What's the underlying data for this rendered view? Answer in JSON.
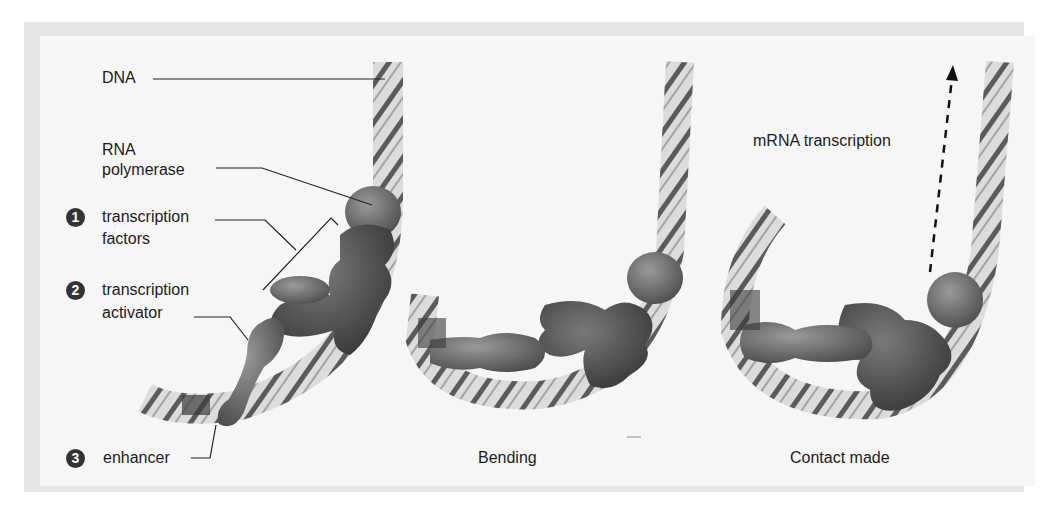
{
  "figure": {
    "panels": [
      {
        "id": "initial",
        "caption": ""
      },
      {
        "id": "bending",
        "caption": "Bending"
      },
      {
        "id": "contact",
        "caption": "Contact made"
      }
    ],
    "labels": {
      "dna": "DNA",
      "rna_polymerase_line1": "RNA",
      "rna_polymerase_line2": "polymerase",
      "transcription_factors_line1": "transcription",
      "transcription_factors_line2": "factors",
      "transcription_activator_line1": "transcription",
      "transcription_activator_line2": "activator",
      "enhancer": "enhancer",
      "mrna_transcription": "mRNA transcription"
    },
    "badges": [
      "1",
      "2",
      "3"
    ],
    "colors": {
      "background": "#f6f6f6",
      "frame": "#e6e6e6",
      "protein_dark": "#555555",
      "protein_mid": "#777777",
      "dna_light": "#d8d8d8",
      "dna_stripe": "#444444",
      "text": "#1c1c1c"
    }
  }
}
